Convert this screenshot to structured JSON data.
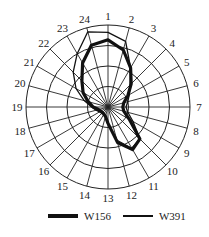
{
  "chart_data": {
    "type": "radar",
    "title": "",
    "categories": [
      "1",
      "2",
      "3",
      "4",
      "5",
      "6",
      "7",
      "8",
      "9",
      "10",
      "11",
      "12",
      "13",
      "14",
      "15",
      "16",
      "17",
      "18",
      "19",
      "20",
      "21",
      "22",
      "23",
      "24"
    ],
    "rings": 4,
    "value_scale": "fraction of outer ring (0-1), estimated",
    "series": [
      {
        "name": "W156",
        "style": "thick",
        "values": [
          0.82,
          0.72,
          0.55,
          0.4,
          0.28,
          0.2,
          0.18,
          0.2,
          0.3,
          0.55,
          0.6,
          0.45,
          0.2,
          0.12,
          0.1,
          0.1,
          0.1,
          0.12,
          0.18,
          0.25,
          0.35,
          0.45,
          0.62,
          0.78
        ]
      },
      {
        "name": "W391",
        "style": "thin",
        "values": [
          0.91,
          0.83,
          0.55,
          0.38,
          0.3,
          0.25,
          0.22,
          0.25,
          0.35,
          0.55,
          0.58,
          0.42,
          0.2,
          0.12,
          0.1,
          0.1,
          0.12,
          0.15,
          0.2,
          0.3,
          0.45,
          0.6,
          0.75,
          0.95
        ]
      }
    ],
    "legend_position": "bottom",
    "grid": true
  },
  "legend": {
    "items": [
      {
        "label": "W156"
      },
      {
        "label": "W391"
      }
    ]
  }
}
